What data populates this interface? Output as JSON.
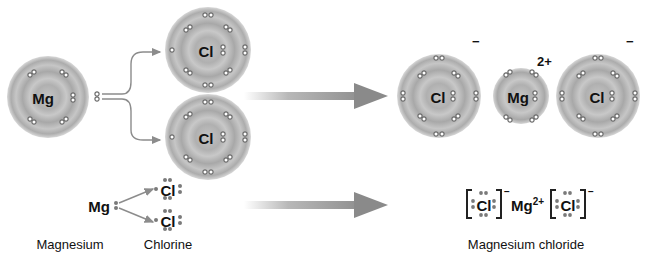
{
  "diagram": {
    "colors": {
      "shell_fill": "#b8b8b8",
      "shell_ring": "#9a9a9a",
      "electron": "#7a7a7a",
      "arrow": "#8c8c8c",
      "text": "#111111"
    },
    "reactants": {
      "magnesium_atom": {
        "symbol": "Mg",
        "valence_electrons": 2
      },
      "chlorine_atom_top": {
        "symbol": "Cl",
        "valence_electrons": 7
      },
      "chlorine_atom_bottom": {
        "symbol": "Cl",
        "valence_electrons": 7
      }
    },
    "products": {
      "chloride_ion_left": {
        "symbol": "Cl",
        "charge": "−"
      },
      "magnesium_ion": {
        "symbol": "Mg",
        "charge": "2+"
      },
      "chloride_ion_right": {
        "symbol": "Cl",
        "charge": "−"
      }
    },
    "lewis": {
      "reactant_mg": "Mg",
      "reactant_cl_top": "Cl",
      "reactant_cl_bottom": "Cl",
      "product_cl_left": "Cl",
      "product_cl_left_charge": "−",
      "product_mg": "Mg",
      "product_mg_charge": "2+",
      "product_cl_right": "Cl",
      "product_cl_right_charge": "−"
    },
    "labels": {
      "magnesium": "Magnesium",
      "chlorine": "Chlorine",
      "product": "Magnesium chloride"
    }
  }
}
